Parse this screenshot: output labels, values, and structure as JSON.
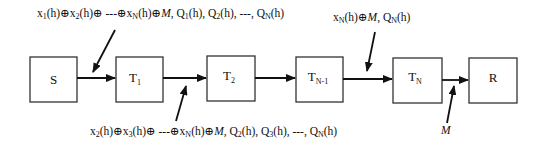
{
  "diagram": {
    "type": "sequential relay chain",
    "nodes": [
      {
        "id": "S",
        "label": "S",
        "sub": ""
      },
      {
        "id": "T1",
        "label": "T",
        "sub": "1"
      },
      {
        "id": "T2",
        "label": "T",
        "sub": "2"
      },
      {
        "id": "TN-1",
        "label": "T",
        "sub": "N-1"
      },
      {
        "id": "TN",
        "label": "T",
        "sub": "N"
      },
      {
        "id": "R",
        "label": "R",
        "sub": ""
      }
    ],
    "edges": [
      {
        "from": "S",
        "to": "T1"
      },
      {
        "from": "T1",
        "to": "T2"
      },
      {
        "from": "T2",
        "to": "TN-1"
      },
      {
        "from": "TN-1",
        "to": "TN"
      },
      {
        "from": "TN",
        "to": "R"
      }
    ],
    "annotations": [
      {
        "id": "ann-s-t1",
        "position": "top-left",
        "targets_edge": "S->T1",
        "text": "x1(h)⊕x2(h)⊕ ---⊕xN(h)⊕M, Q1(h), Q2(h), ---, QN(h)",
        "parts": {
          "p1": "x",
          "s1": "1",
          "p2": "(h)⊕x",
          "s2": "2",
          "p3": "(h)⊕ ---⊕x",
          "s3": "N",
          "p4": "(h)⊕",
          "m": "M",
          "p5": ", Q",
          "s5": "1",
          "p6": "(h), Q",
          "s6": "2",
          "p7": "(h), ---, Q",
          "s7": "N",
          "p8": "(h)"
        }
      },
      {
        "id": "ann-t1-t2",
        "position": "bottom",
        "targets_edge": "T1->T2",
        "text": "x2(h)⊕x3(h)⊕ ---⊕xN(h)⊕M, Q2(h), Q3(h), ---, QN(h)",
        "parts": {
          "p1": "x",
          "s1": "2",
          "p2": "(h)⊕x",
          "s2": "3",
          "p3": "(h)⊕ ---⊕x",
          "s3": "N",
          "p4": "(h)⊕",
          "m": "M",
          "p5": ", Q",
          "s5": "2",
          "p6": "(h), Q",
          "s6": "3",
          "p7": "(h), ---, Q",
          "s7": "N",
          "p8": "(h)"
        }
      },
      {
        "id": "ann-tn1-tn",
        "position": "top-right",
        "targets_edge": "TN-1->TN",
        "text": "xN(h)⊕M, QN(h)",
        "parts": {
          "p1": "x",
          "s1": "N",
          "p2": "(h)⊕",
          "m": "M",
          "p3": ", Q",
          "s3": "N",
          "p4": "(h)"
        }
      },
      {
        "id": "ann-tn-r",
        "position": "bottom-right",
        "targets_edge": "TN->R",
        "text": "M",
        "parts": {
          "m": "M"
        }
      }
    ],
    "colors": {
      "stroke": "#111111",
      "box_stroke": "#333333",
      "background": "#ffffff"
    }
  }
}
